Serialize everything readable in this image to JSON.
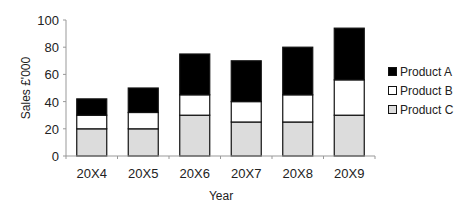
{
  "chart_data": {
    "type": "bar",
    "stacked": true,
    "title": "",
    "xlabel": "Year",
    "ylabel": "Sales £'000",
    "ylim": [
      0,
      100
    ],
    "yticks": [
      0,
      20,
      40,
      60,
      80,
      100
    ],
    "grid": false,
    "legend_position": "right",
    "categories": [
      "20X4",
      "20X5",
      "20X6",
      "20X7",
      "20X8",
      "20X9"
    ],
    "series": [
      {
        "name": "Product C",
        "color": "#dcdcdc",
        "values": [
          20,
          20,
          30,
          25,
          25,
          30
        ]
      },
      {
        "name": "Product B",
        "color": "#ffffff",
        "values": [
          10,
          12,
          15,
          15,
          20,
          26
        ]
      },
      {
        "name": "Product A",
        "color": "#000000",
        "values": [
          12,
          18,
          30,
          30,
          35,
          38
        ]
      }
    ]
  },
  "legend": {
    "items": [
      {
        "label": "Product A",
        "color": "#000000"
      },
      {
        "label": "Product B",
        "color": "#ffffff"
      },
      {
        "label": "Product C",
        "color": "#dcdcdc"
      }
    ]
  }
}
